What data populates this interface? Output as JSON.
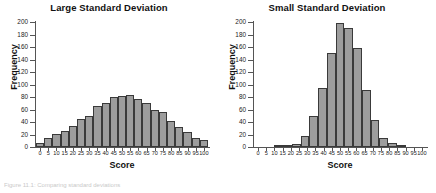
{
  "figure": {
    "caption": "Figure 11.1: Comparing standard deviations",
    "axis_titles": {
      "x": "Score",
      "y": "Frequency"
    }
  },
  "chart_data": [
    {
      "type": "bar",
      "title": "Large Standard Deviation",
      "xlabel": "Score",
      "ylabel": "Frequency",
      "ylim": [
        0,
        200
      ],
      "ytick_values": [
        0,
        20,
        40,
        60,
        80,
        100,
        120,
        140,
        160,
        180,
        200
      ],
      "grid": false,
      "legend": false,
      "categories": [
        "0",
        "5",
        "10",
        "15",
        "20",
        "25",
        "30",
        "35",
        "40",
        "45",
        "50",
        "55",
        "60",
        "65",
        "70",
        "75",
        "80",
        "85",
        "90",
        "95",
        "100"
      ],
      "values": [
        6,
        14,
        21,
        26,
        33,
        45,
        50,
        65,
        70,
        80,
        81,
        83,
        77,
        71,
        60,
        56,
        41,
        32,
        24,
        15,
        12
      ]
    },
    {
      "type": "bar",
      "title": "Small Standard Deviation",
      "xlabel": "Score",
      "ylabel": "Frequency",
      "ylim": [
        0,
        200
      ],
      "ytick_values": [
        0,
        20,
        40,
        60,
        80,
        100,
        120,
        140,
        160,
        180,
        200
      ],
      "grid": false,
      "legend": false,
      "categories": [
        "0",
        "5",
        "10",
        "15",
        "20",
        "25",
        "30",
        "35",
        "40",
        "45",
        "50",
        "55",
        "60",
        "65",
        "70",
        "75",
        "80",
        "85",
        "90",
        "95",
        "100"
      ],
      "values": [
        0,
        0,
        0,
        1,
        2,
        5,
        17,
        49,
        95,
        150,
        198,
        191,
        159,
        92,
        44,
        15,
        7,
        2,
        0,
        0,
        0
      ]
    }
  ]
}
